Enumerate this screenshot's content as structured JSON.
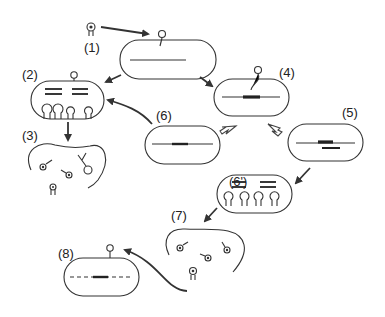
{
  "diagram": {
    "title": "",
    "stages": [
      {
        "id": "1",
        "label": "(1)",
        "description": "phage particle attaches to bacterial cell"
      },
      {
        "id": "2",
        "label": "(2)",
        "description": "phage DNA replication and assembly of new phages inside cell"
      },
      {
        "id": "3",
        "label": "(3)",
        "description": "cell lysis releasing phages"
      },
      {
        "id": "4",
        "label": "(4)",
        "description": "phage DNA integrates into bacterial chromosome"
      },
      {
        "id": "5",
        "label": "(5)",
        "description": "lysogenic cell with prophage; excision"
      },
      {
        "id": "6",
        "label": "(6)",
        "description": "cell division with prophage"
      },
      {
        "id": "6p",
        "label": "(6')",
        "description": "induced prophage replication and phage assembly"
      },
      {
        "id": "7",
        "label": "(7)",
        "description": "cell lysis releasing phages"
      },
      {
        "id": "8",
        "label": "(8)",
        "description": "transducing phage infects new cell"
      }
    ],
    "colors": {
      "stroke": "#333333",
      "background": "#ffffff"
    }
  }
}
